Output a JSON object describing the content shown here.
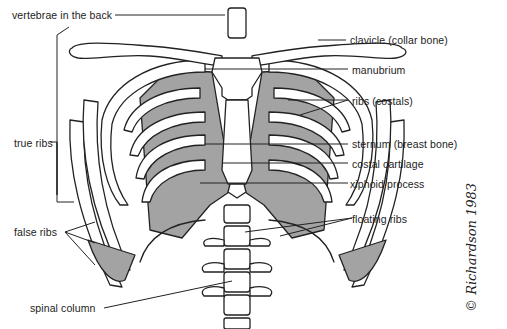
{
  "diagram": {
    "colors": {
      "line": "#222222",
      "cartilage": "#a3a3a3",
      "bone": "#ffffff",
      "background": "#ffffff"
    },
    "labels": {
      "vertebrae": "vertebrae in the back",
      "true_ribs": "true ribs",
      "false_ribs": "false ribs",
      "spinal_column": "spinal column",
      "clavicle": "clavicle (collar bone)",
      "manubrium": "manubrium",
      "ribs": "ribs (costals)",
      "sternum": "sternum (breast bone)",
      "costal_cartilage": "costal cartilage",
      "xiphoid": "xiphoid process",
      "floating_ribs": "floating ribs"
    },
    "signature": "© Richardson 1983"
  }
}
